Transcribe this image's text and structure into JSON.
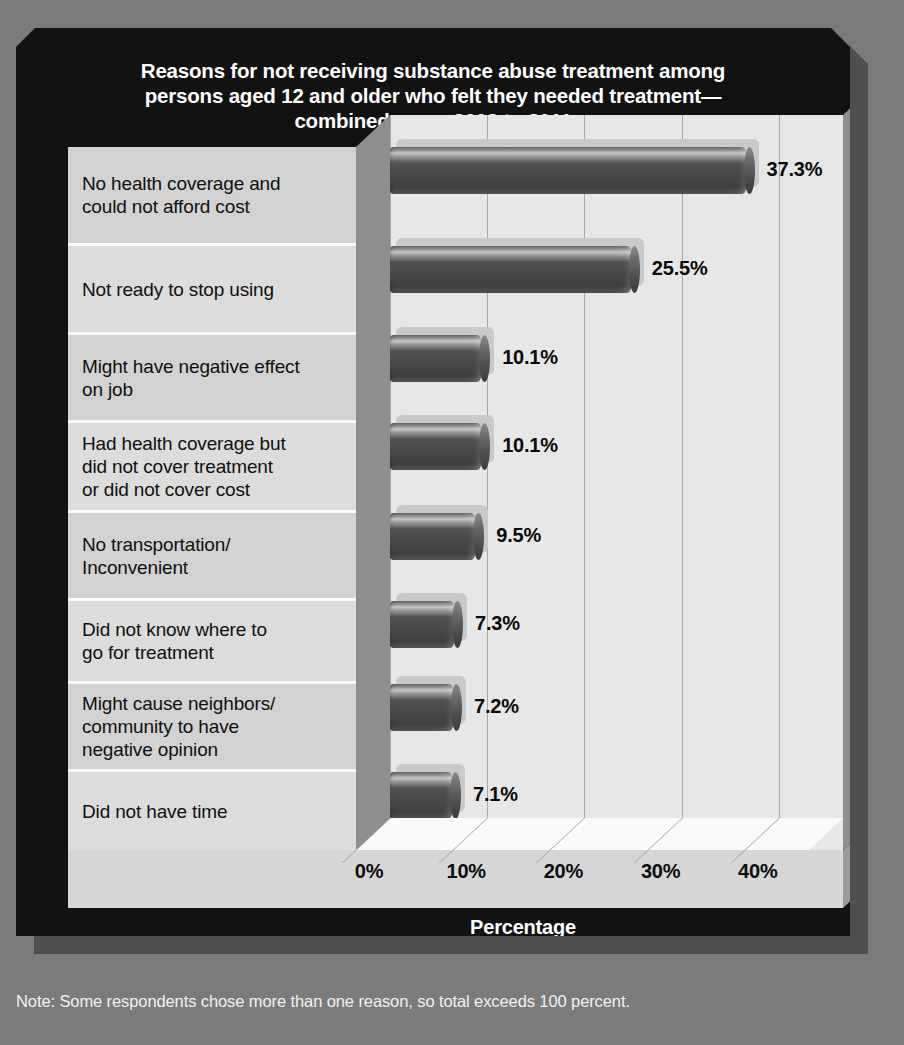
{
  "chart_title": "Reasons for not receiving substance abuse treatment among persons aged 12 and older who felt they needed treatment—combined years 2008 to 2011",
  "title_lines": [
    "Reasons for not receiving substance abuse treatment among",
    "persons aged 12 and older who felt they needed treatment—",
    "combined years 2008 to 2011"
  ],
  "axis_title": "Percentage",
  "note": "Note: Some respondents chose more than one reason, so total exceeds 100 percent.",
  "top_sliver": "",
  "colors": {
    "page_background": "#7b7b7b",
    "panel_background": "#121212",
    "panel_shadow": "#4f4f4f",
    "plot_background": "#e7e7e7",
    "label_panel": "#d2d2d2",
    "bar_fill": "#4a4a4a",
    "gridline": "#a8a8a8",
    "title_text": "#ffffff",
    "label_text": "#101010",
    "note_text": "#f2f2f2"
  },
  "chart_data": {
    "type": "bar",
    "orientation": "horizontal",
    "xlabel": "Percentage",
    "ylabel": "",
    "xlim": [
      0,
      50
    ],
    "xticks": [
      0,
      10,
      20,
      30,
      40
    ],
    "xtick_labels": [
      "0%",
      "10%",
      "20%",
      "30%",
      "40%"
    ],
    "grid": true,
    "legend": "none",
    "categories": [
      "No health coverage and could not afford cost",
      "Not ready to stop using",
      "Might have negative effect on job",
      "Had health coverage but did not cover treatment or did not cover cost",
      "No transportation/ Inconvenient",
      "Did not know where to go for treatment",
      "Might cause neighbors/ community to have negative opinion",
      "Did not have time"
    ],
    "values": [
      37.3,
      25.5,
      10.1,
      10.1,
      9.5,
      7.3,
      7.2,
      7.1
    ],
    "value_labels": [
      "37.3%",
      "25.5%",
      "10.1%",
      "10.1%",
      "9.5%",
      "7.3%",
      "7.2%",
      "7.1%"
    ],
    "annotations": [
      "Note: Some respondents chose more than one reason, so total exceeds 100 percent."
    ]
  },
  "rows": [
    {
      "lines": [
        "No health coverage and",
        "could not afford cost"
      ],
      "value_label": "37.3%",
      "value": 37.3,
      "height": 99
    },
    {
      "lines": [
        "Not ready to stop using"
      ],
      "value_label": "25.5%",
      "value": 25.5,
      "height": 89
    },
    {
      "lines": [
        "Might have negative effect",
        "on job"
      ],
      "value_label": "10.1%",
      "value": 10.1,
      "height": 88
    },
    {
      "lines": [
        "Had health coverage but",
        "did not cover treatment",
        "or did not cover cost"
      ],
      "value_label": "10.1%",
      "value": 10.1,
      "height": 90
    },
    {
      "lines": [
        "No transportation/",
        "Inconvenient"
      ],
      "value_label": "9.5%",
      "value": 9.5,
      "height": 88
    },
    {
      "lines": [
        "Did not know where to",
        "go for treatment"
      ],
      "value_label": "7.3%",
      "value": 7.3,
      "height": 83
    },
    {
      "lines": [
        "Might cause neighbors/",
        "community to have",
        "negative opinion"
      ],
      "value_label": "7.2%",
      "value": 7.2,
      "height": 88
    },
    {
      "lines": [
        "Did not have time"
      ],
      "value_label": "7.1%",
      "value": 7.1,
      "height": 78
    }
  ]
}
